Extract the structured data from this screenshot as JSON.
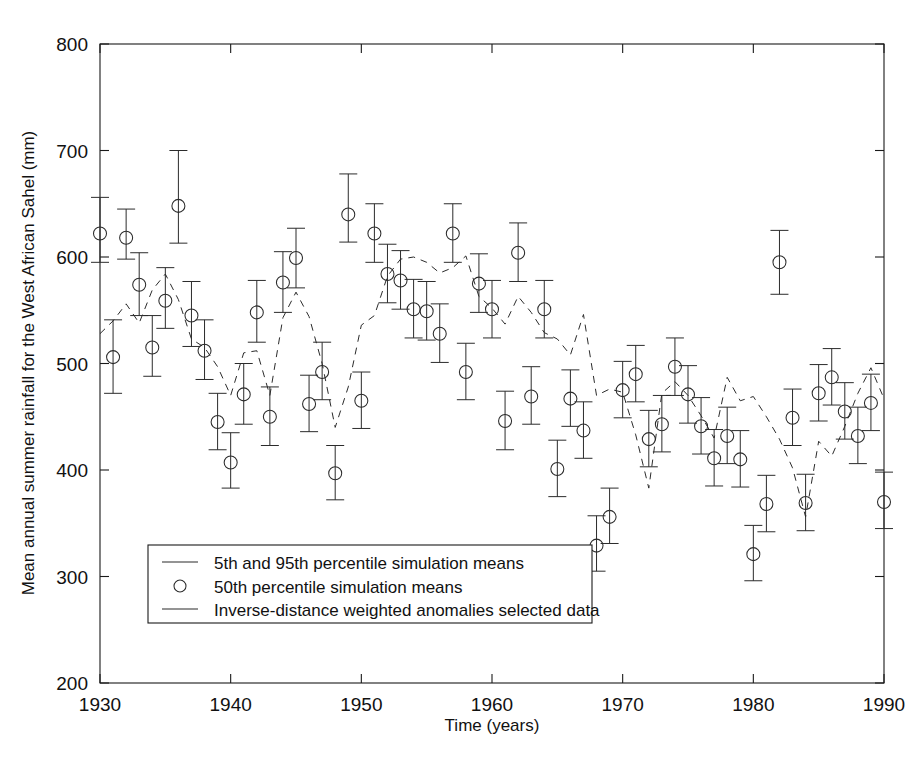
{
  "chart_data": {
    "type": "scatter",
    "title": "",
    "xlabel": "Time (years)",
    "ylabel": "Mean annual summer rainfall for the West African Sahel (mm)",
    "xlim": [
      1930,
      1990
    ],
    "ylim": [
      200,
      800
    ],
    "xticks": [
      1930,
      1940,
      1950,
      1960,
      1970,
      1980,
      1990
    ],
    "yticks": [
      200,
      300,
      400,
      500,
      600,
      700,
      800
    ],
    "grid": false,
    "legend_position": "lower-left-inside",
    "legend": [
      {
        "marker": "line",
        "label": "5th and 95th percentile simulation means"
      },
      {
        "marker": "circle",
        "label": "50th percentile simulation means"
      },
      {
        "marker": "dashed-line",
        "label": "Inverse-distance weighted anomalies selected data"
      }
    ],
    "x": [
      1930,
      1931,
      1932,
      1933,
      1934,
      1935,
      1936,
      1937,
      1938,
      1939,
      1940,
      1941,
      1942,
      1943,
      1944,
      1945,
      1946,
      1947,
      1948,
      1949,
      1950,
      1951,
      1952,
      1953,
      1954,
      1955,
      1956,
      1957,
      1958,
      1959,
      1960,
      1961,
      1962,
      1963,
      1964,
      1965,
      1966,
      1967,
      1968,
      1969,
      1970,
      1971,
      1972,
      1973,
      1974,
      1975,
      1976,
      1977,
      1978,
      1979,
      1980,
      1981,
      1982,
      1983,
      1984,
      1985,
      1986,
      1987,
      1988,
      1989,
      1990
    ],
    "series": [
      {
        "name": "50th percentile simulation means",
        "marker": "circle",
        "values": [
          622,
          506,
          618,
          574,
          515,
          559,
          648,
          545,
          512,
          445,
          407,
          471,
          548,
          450,
          576,
          599,
          462,
          492,
          397,
          640,
          465,
          622,
          584,
          578,
          551,
          549,
          528,
          622,
          492,
          575,
          551,
          446,
          604,
          469,
          551,
          401,
          467,
          437,
          329,
          356,
          475,
          490,
          429,
          443,
          497,
          471,
          441,
          411,
          432,
          410,
          321,
          368,
          595,
          449,
          369,
          472,
          487,
          455,
          432,
          463,
          370
        ]
      },
      {
        "name": "5th percentile simulation means",
        "marker": "lower-error-cap",
        "values": [
          595,
          472,
          598,
          545,
          488,
          533,
          613,
          516,
          485,
          419,
          383,
          443,
          520,
          423,
          548,
          571,
          436,
          466,
          372,
          614,
          439,
          595,
          557,
          551,
          524,
          522,
          501,
          595,
          466,
          548,
          524,
          419,
          577,
          443,
          524,
          375,
          441,
          411,
          305,
          331,
          449,
          464,
          403,
          417,
          470,
          444,
          415,
          385,
          406,
          384,
          296,
          342,
          565,
          423,
          343,
          446,
          461,
          429,
          406,
          437,
          345
        ]
      },
      {
        "name": "95th percentile simulation means",
        "marker": "upper-error-cap",
        "values": [
          656,
          541,
          645,
          604,
          545,
          590,
          700,
          577,
          541,
          472,
          435,
          500,
          578,
          478,
          605,
          627,
          489,
          520,
          423,
          678,
          492,
          650,
          612,
          606,
          579,
          577,
          556,
          650,
          519,
          603,
          578,
          474,
          632,
          497,
          578,
          428,
          494,
          464,
          357,
          383,
          502,
          517,
          456,
          470,
          524,
          498,
          468,
          438,
          459,
          437,
          348,
          395,
          625,
          476,
          396,
          499,
          514,
          482,
          459,
          490,
          398
        ]
      },
      {
        "name": "Inverse-distance weighted anomalies selected data",
        "marker": "dashed-line",
        "values": [
          528,
          540,
          556,
          538,
          569,
          584,
          560,
          523,
          515,
          497,
          470,
          510,
          512,
          470,
          543,
          567,
          544,
          500,
          440,
          478,
          536,
          545,
          582,
          598,
          600,
          595,
          585,
          590,
          601,
          563,
          552,
          537,
          563,
          548,
          529,
          523,
          508,
          546,
          470,
          476,
          473,
          433,
          383,
          472,
          483,
          470,
          451,
          430,
          487,
          465,
          469,
          450,
          429,
          402,
          356,
          427,
          413,
          441,
          472,
          496,
          467
        ]
      }
    ]
  },
  "axes": {
    "x_tick_labels": [
      "1930",
      "1940",
      "1950",
      "1960",
      "1970",
      "1980",
      "1990"
    ],
    "y_tick_labels": [
      "200",
      "300",
      "400",
      "500",
      "600",
      "700",
      "800"
    ],
    "x_title": "Time (years)",
    "y_title": "Mean annual summer rainfall for the West African Sahel (mm)"
  },
  "legend": {
    "item1": "5th and 95th percentile simulation means",
    "item2": "50th percentile simulation means",
    "item3": "Inverse-distance weighted anomalies selected data"
  },
  "colors": {
    "ink": "#1a1a1a",
    "data": "#2b2b2b",
    "background": "#ffffff"
  }
}
